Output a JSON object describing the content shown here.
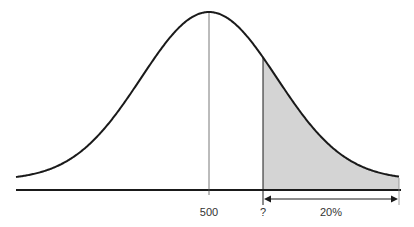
{
  "chart_data": {
    "type": "area",
    "title": "",
    "xlabel": "",
    "ylabel": "",
    "distribution": "normal",
    "mean": 500,
    "tick_labels": [
      "500",
      "?"
    ],
    "shaded_region": {
      "from": "?",
      "to": "right tail",
      "percent_label": "20%"
    },
    "annotations": [
      "500",
      "?",
      "20%"
    ],
    "grid": false,
    "legend": null
  },
  "labels": {
    "mean": "500",
    "cutoff": "?",
    "tail_percent": "20%"
  },
  "colors": {
    "curve": "#1a1a1a",
    "shade": "#d4d4d4",
    "axis": "#1a1a1a"
  }
}
